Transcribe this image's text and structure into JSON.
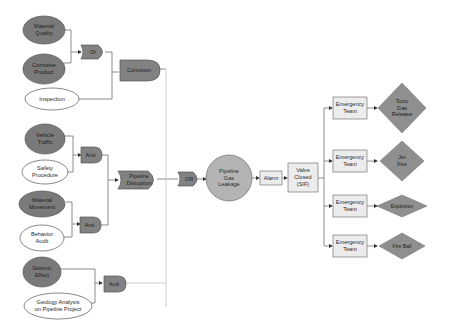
{
  "diagram": {
    "type": "fault-tree / bow-tie",
    "colors": {
      "dark_node": "#7a7a7a",
      "light_node": "#ffffff",
      "gate": "#828282",
      "top_event": "#b4b4b4",
      "box": "#ececec",
      "consequence": "#8f8f8f",
      "line": "#6e6e6e",
      "line_light": "#c8c8c8"
    },
    "basic_events": {
      "material_quality": "Material\nQuality",
      "corrosive_product": "Corrosive\nProduct",
      "inspection": "Inspection",
      "vehicle_traffic": "Vehicle\nTraffic",
      "safety_procedure": "Safety\nProcedure",
      "material_movement": "Material\nMovement",
      "behavior_audit": "Behavior\nAudit",
      "seismic_effect": "Seismic\nEffect",
      "geology_analysis": "Geology Analysis\non Pipeline Project"
    },
    "gates": {
      "or_1": "Or",
      "and_1": "And",
      "and_2": "And",
      "and_3": "And",
      "or_main": "OR"
    },
    "intermediate_events": {
      "corrosion": "Corrosion",
      "pipeline_disruption": "Pipeline\nDisruption"
    },
    "top_event": "Pipeline\nGas\nLeakage",
    "barriers": {
      "alarm": "Alarm",
      "valve_closed": "Valve\nClosed\n(SIF)"
    },
    "responses": [
      {
        "label": "Emergency\nTeam",
        "consequence": "Toxic\nGas\nRelease"
      },
      {
        "label": "Emergency\nTeam",
        "consequence": "Jet\nFire"
      },
      {
        "label": "Emergency\nTeam",
        "consequence": "Explosion"
      },
      {
        "label": "Emergency\nTeam",
        "consequence": "Fire Ball"
      }
    ]
  }
}
